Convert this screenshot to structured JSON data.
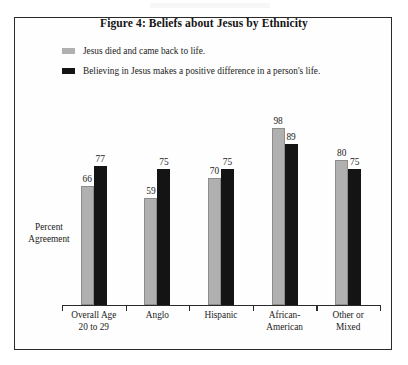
{
  "chart_data": {
    "type": "bar",
    "title": "Figure 4: Beliefs about Jesus by Ethnicity",
    "xlabel": "",
    "ylabel": "Percent Agreement",
    "ylim": [
      0,
      100
    ],
    "grid": false,
    "legend_position": "top-left",
    "categories": [
      "Overall Age 20 to 29",
      "Anglo",
      "Hispanic",
      "African-American",
      "Other or Mixed"
    ],
    "category_lines": [
      [
        "Overall Age",
        "20 to 29"
      ],
      [
        "Anglo"
      ],
      [
        "Hispanic"
      ],
      [
        "African-",
        "American"
      ],
      [
        "Other or",
        "Mixed"
      ]
    ],
    "series": [
      {
        "name": "Jesus died and came back to life.",
        "color": "#b0b0b0",
        "values": [
          66,
          59,
          70,
          98,
          80
        ]
      },
      {
        "name": "Believing in Jesus makes a positive difference in a person's life.",
        "color": "#141414",
        "values": [
          77,
          75,
          75,
          89,
          75
        ]
      }
    ]
  },
  "y_axis_label_lines": [
    "Percent",
    "Agreement"
  ],
  "colors": {
    "series_light": "#b0b0b0",
    "series_dark": "#141414",
    "frame": "#2a2a2a",
    "background": "#ffffff",
    "text": "#1c1c1c"
  }
}
